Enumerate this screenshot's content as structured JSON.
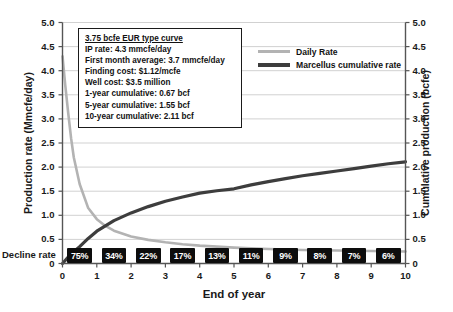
{
  "chart_data": {
    "type": "line",
    "title": "",
    "xlabel": "End of year",
    "ylabel": "Production rate (Mmcfe/day)",
    "ylabel_right": "Cumulative production (bcfe)",
    "xlim": [
      0,
      10
    ],
    "ylim": [
      0,
      5.0
    ],
    "ylim_right": [
      0,
      5.0
    ],
    "grid": true,
    "legend_position": "top-right",
    "x_ticks": [
      "0",
      "1",
      "2",
      "3",
      "4",
      "5",
      "6",
      "7",
      "8",
      "9",
      "10"
    ],
    "y_ticks": [
      "0",
      "0.5",
      "1.0",
      "1.5",
      "2.0",
      "2.5",
      "3.0",
      "3.5",
      "4.0",
      "4.5",
      "5.0"
    ],
    "y_ticks_right": [
      "0",
      "0.5",
      "1.0",
      "1.5",
      "2.0",
      "2.5",
      "3.0",
      "3.5",
      "4.0",
      "4.5",
      "5.0"
    ],
    "series": [
      {
        "name": "Daily Rate",
        "color": "#b3b3b3",
        "axis": "left",
        "x": [
          0,
          0.08,
          0.17,
          0.25,
          0.33,
          0.5,
          0.75,
          1.0,
          1.25,
          1.5,
          2.0,
          2.5,
          3.0,
          3.5,
          4.0,
          4.5,
          5.0,
          6.0,
          7.0,
          8.0,
          9.0,
          10.0
        ],
        "values": [
          4.3,
          3.7,
          3.1,
          2.6,
          2.2,
          1.65,
          1.15,
          0.92,
          0.78,
          0.68,
          0.56,
          0.49,
          0.44,
          0.4,
          0.37,
          0.35,
          0.33,
          0.3,
          0.28,
          0.27,
          0.26,
          0.25
        ]
      },
      {
        "name": "Marcellus cumulative rate",
        "color": "#3d3d3d",
        "axis": "right",
        "x": [
          0,
          0.25,
          0.5,
          0.75,
          1.0,
          1.5,
          2.0,
          2.5,
          3.0,
          3.5,
          4.0,
          4.5,
          5.0,
          5.5,
          6.0,
          6.5,
          7.0,
          7.5,
          8.0,
          8.5,
          9.0,
          9.5,
          10.0
        ],
        "values": [
          0,
          0.2,
          0.35,
          0.52,
          0.67,
          0.89,
          1.05,
          1.18,
          1.29,
          1.38,
          1.46,
          1.51,
          1.55,
          1.63,
          1.7,
          1.76,
          1.82,
          1.87,
          1.92,
          1.97,
          2.02,
          2.07,
          2.11
        ]
      }
    ],
    "annotations": {
      "decline_rate_label": "Decline rate",
      "decline_rates": [
        "75%",
        "34%",
        "22%",
        "17%",
        "13%",
        "11%",
        "9%",
        "8%",
        "7%",
        "6%"
      ]
    }
  },
  "infobox": {
    "lines": [
      "3.75 bcfe EUR type curve",
      "IP rate: 4.3 mmcfe/day",
      "First month average: 3.7 mmcfe/day",
      "Finding cost: $1.12/mcfe",
      "Well cost: $3.5 million",
      "1-year cumulative: 0.67 bcf",
      "5-year cumulative: 1.55 bcf",
      "10-year cumulative: 2.11 bcf"
    ]
  },
  "legend": {
    "items": [
      {
        "label": "Daily Rate",
        "color": "#b3b3b3",
        "width": 3
      },
      {
        "label": "Marcellus cumulative rate",
        "color": "#3d3d3d",
        "width": 4
      }
    ]
  },
  "colors": {
    "daily_rate": "#b3b3b3",
    "cumulative": "#3d3d3d",
    "grid": "#cccccc",
    "axis": "#555555",
    "decline_box_bg": "#0d0d0d",
    "decline_box_text": "#ffffff"
  }
}
